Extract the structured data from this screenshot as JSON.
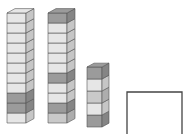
{
  "colors": {
    "light": "#e6e6e6",
    "mid": "#c9c9c9",
    "dark": "#9b9b9b",
    "edge": "#555555",
    "box_stroke": "#444444"
  },
  "stacks": [
    {
      "name": "stack-1",
      "count": 11,
      "x": 7,
      "bottom": 123,
      "width": 19,
      "depth": 8,
      "cube_h": 10,
      "cubes": [
        "light",
        "dark",
        "dark",
        "light",
        "light",
        "light",
        "light",
        "light",
        "light",
        "light",
        "light"
      ]
    },
    {
      "name": "stack-2",
      "count": 11,
      "x": 48,
      "bottom": 123,
      "width": 19,
      "depth": 8,
      "cube_h": 10,
      "cubes": [
        "mid",
        "dark",
        "light",
        "light",
        "dark",
        "light",
        "light",
        "light",
        "light",
        "light",
        "dark"
      ]
    },
    {
      "name": "stack-3",
      "count": 5,
      "x": 87,
      "bottom": 127,
      "width": 15,
      "depth": 7,
      "cube_h": 12,
      "cubes": [
        "dark",
        "light",
        "mid",
        "light",
        "dark"
      ]
    }
  ],
  "empty_box": {
    "x": 127,
    "y": 92,
    "width": 55,
    "height": 45
  }
}
